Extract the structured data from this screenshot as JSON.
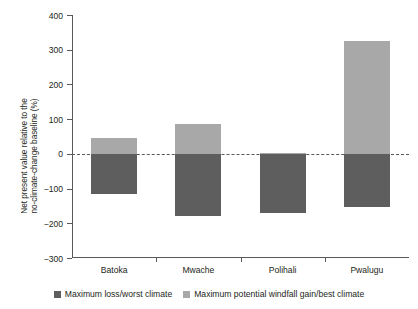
{
  "chart_data": {
    "type": "bar",
    "title": "",
    "subtitle": "",
    "xlabel": "",
    "ylabel": "Net present value relative to the no-climate-change baseline (%)",
    "ylabel_lines": [
      "Net present value relative to the",
      "no-climate-change baseline (%)"
    ],
    "categories": [
      "Batoka",
      "Mwache",
      "Polihali",
      "Pwalugu"
    ],
    "ylim": [
      -300,
      400
    ],
    "yticks": [
      400,
      300,
      200,
      100,
      0,
      -100,
      -200,
      -300
    ],
    "ytick_labels": [
      "400",
      "300",
      "200",
      "100",
      "0",
      "−100",
      "−200",
      "−300"
    ],
    "grid": false,
    "zero_reference_line": true,
    "legend_position": "bottom",
    "series": [
      {
        "name": "Maximum loss/worst climate",
        "color": "#5e5e5e",
        "values": [
          -117,
          -180,
          -170,
          -152
        ]
      },
      {
        "name": "Maximum potential windfall gain/best climate",
        "color": "#a8a8a8",
        "values": [
          47,
          85,
          3,
          325
        ]
      }
    ]
  },
  "legend": {
    "items": [
      {
        "label": "Maximum loss/worst climate",
        "color": "#5e5e5e"
      },
      {
        "label": "Maximum potential windfall gain/best climate",
        "color": "#a8a8a8"
      }
    ]
  },
  "colors": {
    "axis": "#58595b",
    "text": "#231f20",
    "background": "#ffffff",
    "series_loss": "#5e5e5e",
    "series_gain": "#a8a8a8"
  }
}
